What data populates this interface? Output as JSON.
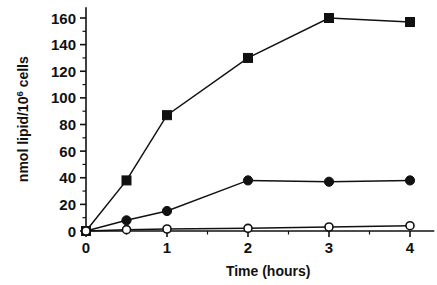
{
  "chart_data": {
    "type": "line",
    "title": "",
    "subtitle": "",
    "xlabel": "Time (hours)",
    "ylabel": "nmol lipid/10",
    "ylabel_superscript": "6",
    "ylabel_suffix": " cells",
    "x": [
      0,
      0.5,
      1,
      2,
      3,
      4
    ],
    "xlim": [
      0,
      4.3
    ],
    "ylim": [
      0,
      168
    ],
    "xticks": [
      0,
      1,
      2,
      3,
      4
    ],
    "xtick_labels": [
      "0",
      "1",
      "2",
      "3",
      "4"
    ],
    "xminor_ticks": [
      0.5,
      1.5,
      2.5,
      3.5
    ],
    "yticks": [
      0,
      20,
      40,
      60,
      80,
      100,
      120,
      140,
      160
    ],
    "ytick_labels": [
      "0",
      "20",
      "40",
      "60",
      "80",
      "100",
      "120",
      "140",
      "160"
    ],
    "yminor_ticks": [
      10,
      30,
      50,
      70,
      90,
      110,
      130,
      150
    ],
    "grid": false,
    "legend": "none",
    "series": [
      {
        "name": "filled-square-series",
        "marker": "filled-square",
        "color": "#111111",
        "values": [
          0,
          38,
          87,
          130,
          160,
          157
        ]
      },
      {
        "name": "filled-circle-series",
        "marker": "filled-circle",
        "color": "#111111",
        "values": [
          0,
          8,
          15,
          38,
          37,
          38
        ]
      },
      {
        "name": "open-circle-series",
        "marker": "open-circle",
        "color": "#111111",
        "values": [
          0,
          1,
          1.5,
          2,
          3,
          4
        ]
      }
    ]
  }
}
